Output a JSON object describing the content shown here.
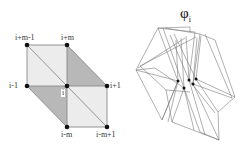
{
  "left_diagram": {
    "nodes": {
      "top_left": "i+m-1",
      "top_mid": "i+m",
      "mid_left": "i-1",
      "center": "i",
      "mid_right": "i+1",
      "bottom_mid": "i-m",
      "bottom_right": "i-m+1"
    },
    "colors": {
      "light_fill": "#ececec",
      "dark_fill": "#b8b8b8",
      "edge": "#8a8a8a",
      "node": "#111111"
    }
  },
  "right_diagram": {
    "title": "φ",
    "subscript": "i",
    "colors": {
      "line": "#777777",
      "node": "#111111"
    }
  }
}
